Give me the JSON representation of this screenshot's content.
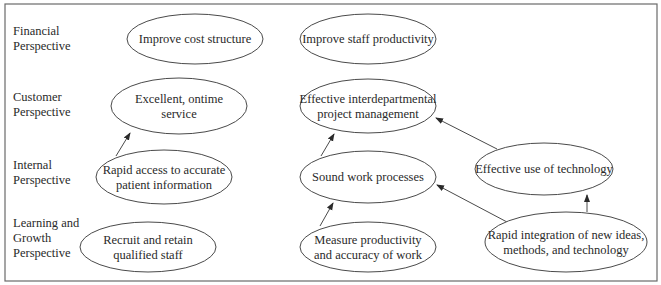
{
  "rows": [
    {
      "id": "financial",
      "lines": [
        "Financial",
        "Perspective"
      ],
      "x": 13,
      "y": 38
    },
    {
      "id": "customer",
      "lines": [
        "Customer",
        "Perspective"
      ],
      "x": 13,
      "y": 104
    },
    {
      "id": "internal",
      "lines": [
        "Internal",
        "Perspective"
      ],
      "x": 13,
      "y": 172
    },
    {
      "id": "learning",
      "lines": [
        "Learning and",
        "Growth",
        "Perspective"
      ],
      "x": 13,
      "y": 238
    }
  ],
  "nodes": [
    {
      "id": "improve-cost-structure",
      "lines": [
        "Improve cost structure"
      ],
      "cx": 195,
      "cy": 39,
      "rx": 68,
      "ry": 25
    },
    {
      "id": "improve-staff-productivity",
      "lines": [
        "Improve staff productivity"
      ],
      "cx": 368,
      "cy": 39,
      "rx": 68,
      "ry": 25
    },
    {
      "id": "excellent-ontime-service",
      "lines": [
        "Excellent, ontime",
        "service"
      ],
      "cx": 179,
      "cy": 106,
      "rx": 68,
      "ry": 28
    },
    {
      "id": "effective-interdepartmental-pm",
      "lines": [
        "Effective interdepartmental",
        "project management"
      ],
      "cx": 368,
      "cy": 106,
      "rx": 68,
      "ry": 27
    },
    {
      "id": "rapid-access-patient-info",
      "lines": [
        "Rapid access to accurate",
        "patient information"
      ],
      "cx": 164,
      "cy": 177,
      "rx": 68,
      "ry": 27
    },
    {
      "id": "sound-work-processes",
      "lines": [
        "Sound work processes"
      ],
      "cx": 368,
      "cy": 177,
      "rx": 68,
      "ry": 26
    },
    {
      "id": "effective-use-of-technology",
      "lines": [
        "Effective use of technology"
      ],
      "cx": 544,
      "cy": 169,
      "rx": 69,
      "ry": 26
    },
    {
      "id": "recruit-retain-staff",
      "lines": [
        "Recruit and retain",
        "qualified staff"
      ],
      "cx": 148,
      "cy": 247,
      "rx": 68,
      "ry": 25
    },
    {
      "id": "measure-productivity-accuracy",
      "lines": [
        "Measure productivity",
        "and accuracy of work"
      ],
      "cx": 368,
      "cy": 247,
      "rx": 68,
      "ry": 25
    },
    {
      "id": "rapid-integration-new-ideas",
      "lines": [
        "Rapid integration of new ideas,",
        "methods, and technology"
      ],
      "cx": 566,
      "cy": 242,
      "rx": 81,
      "ry": 30
    }
  ],
  "edges": [
    {
      "from": "rapid-access-patient-info",
      "to": "excellent-ontime-service",
      "x1": 116,
      "y1": 156,
      "x2": 130,
      "y2": 133
    },
    {
      "from": "sound-work-processes",
      "to": "effective-interdepartmental-pm",
      "x1": 321,
      "y1": 156,
      "x2": 334,
      "y2": 134
    },
    {
      "from": "effective-use-of-technology",
      "to": "effective-interdepartmental-pm",
      "x1": 497,
      "y1": 149,
      "x2": 436,
      "y2": 118
    },
    {
      "from": "measure-productivity-accuracy",
      "to": "sound-work-processes",
      "x1": 320,
      "y1": 226,
      "x2": 333,
      "y2": 203
    },
    {
      "from": "rapid-integration-new-ideas",
      "to": "sound-work-processes",
      "x1": 507,
      "y1": 222,
      "x2": 437,
      "y2": 185
    },
    {
      "from": "rapid-integration-new-ideas",
      "to": "effective-use-of-technology",
      "x1": 587,
      "y1": 212,
      "x2": 587,
      "y2": 195
    }
  ],
  "frame": {
    "x": 5,
    "y": 4,
    "width": 652,
    "height": 277
  }
}
